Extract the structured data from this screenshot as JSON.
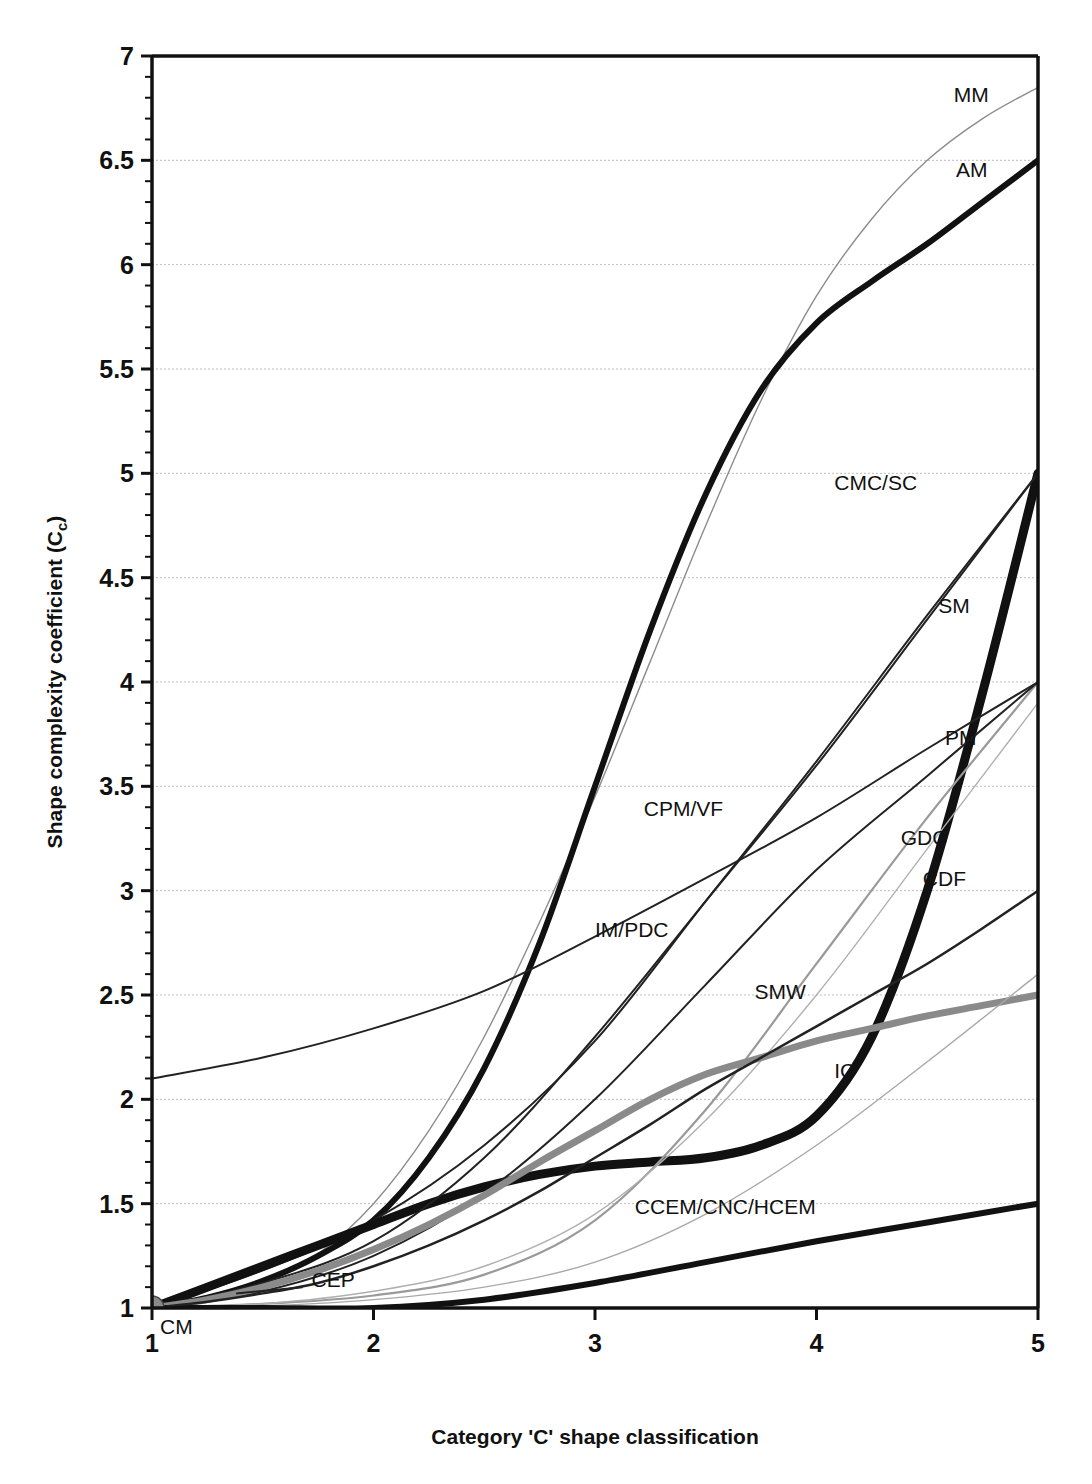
{
  "chart_data": {
    "type": "line",
    "title": "",
    "xlabel": "Category 'C' shape classification",
    "ylabel": "Shape complexity coefficient (C",
    "ylabel_sub": "c",
    "ylabel_tail": ")",
    "xlim": [
      1,
      5
    ],
    "ylim": [
      1,
      7
    ],
    "grid": true,
    "legend_position": "inline-right-labels",
    "x_ticks": [
      "1",
      "2",
      "3",
      "4",
      "5"
    ],
    "x_tick_values": [
      1,
      2,
      3,
      4,
      5
    ],
    "y_ticks": [
      "1",
      "1.5",
      "2",
      "2.5",
      "3",
      "3.5",
      "4",
      "4.5",
      "5",
      "5.5",
      "6",
      "6.5",
      "7"
    ],
    "y_tick_values": [
      1,
      1.5,
      2,
      2.5,
      3,
      3.5,
      4,
      4.5,
      5,
      5.5,
      6,
      6.5,
      7
    ],
    "y_minor_step": 0.1,
    "origin_marker": {
      "label": "CM",
      "x": 1,
      "y": 1,
      "color": "#8a8a8a"
    },
    "series": [
      {
        "name": "MM",
        "style": "thin",
        "color": "#8c8c8c",
        "width": 1.4,
        "label_x": 4.62,
        "label_y": 6.78,
        "points": [
          [
            1,
            1.0
          ],
          [
            1.25,
            1.04
          ],
          [
            1.5,
            1.12
          ],
          [
            1.75,
            1.26
          ],
          [
            2,
            1.5
          ],
          [
            2.25,
            1.85
          ],
          [
            2.5,
            2.3
          ],
          [
            2.75,
            2.85
          ],
          [
            3,
            3.45
          ],
          [
            3.25,
            4.1
          ],
          [
            3.5,
            4.75
          ],
          [
            3.75,
            5.35
          ],
          [
            4,
            5.85
          ],
          [
            4.25,
            6.22
          ],
          [
            4.5,
            6.5
          ],
          [
            4.75,
            6.7
          ],
          [
            5,
            6.85
          ]
        ]
      },
      {
        "name": "AM",
        "style": "thick",
        "color": "#111111",
        "width": 6,
        "label_x": 4.63,
        "label_y": 6.42,
        "points": [
          [
            1,
            1.0
          ],
          [
            1.25,
            1.05
          ],
          [
            1.5,
            1.13
          ],
          [
            1.75,
            1.25
          ],
          [
            2,
            1.42
          ],
          [
            2.25,
            1.72
          ],
          [
            2.5,
            2.15
          ],
          [
            2.75,
            2.75
          ],
          [
            3,
            3.5
          ],
          [
            3.25,
            4.25
          ],
          [
            3.5,
            4.9
          ],
          [
            3.75,
            5.4
          ],
          [
            4,
            5.72
          ],
          [
            4.25,
            5.92
          ],
          [
            4.5,
            6.1
          ],
          [
            4.75,
            6.3
          ],
          [
            5,
            6.5
          ]
        ]
      },
      {
        "name": "CMC/SC",
        "style": "thin",
        "color": "#222222",
        "width": 2,
        "label_x": 4.08,
        "label_y": 4.92,
        "points": [
          [
            1,
            1.0
          ],
          [
            1.5,
            1.18
          ],
          [
            2,
            1.42
          ],
          [
            2.5,
            1.78
          ],
          [
            3,
            2.28
          ],
          [
            3.5,
            2.95
          ],
          [
            4,
            3.62
          ],
          [
            4.5,
            4.32
          ],
          [
            5,
            5.0
          ]
        ]
      },
      {
        "name": "SM",
        "style": "very-thick",
        "color": "#111111",
        "width": 9,
        "label_x": 4.55,
        "label_y": 4.33,
        "points": [
          [
            1,
            1.0
          ],
          [
            1.25,
            1.1
          ],
          [
            1.5,
            1.2
          ],
          [
            1.75,
            1.3
          ],
          [
            2,
            1.4
          ],
          [
            2.25,
            1.5
          ],
          [
            2.5,
            1.58
          ],
          [
            2.75,
            1.64
          ],
          [
            3,
            1.68
          ],
          [
            3.25,
            1.7
          ],
          [
            3.5,
            1.72
          ],
          [
            3.75,
            1.78
          ],
          [
            4,
            1.92
          ],
          [
            4.25,
            2.3
          ],
          [
            4.5,
            3.0
          ],
          [
            4.75,
            3.95
          ],
          [
            5,
            5.0
          ]
        ]
      },
      {
        "name": "PM",
        "style": "thin",
        "color": "#222222",
        "width": 2,
        "label_x": 4.58,
        "label_y": 3.7,
        "points": [
          [
            1,
            2.1
          ],
          [
            1.5,
            2.2
          ],
          [
            2,
            2.34
          ],
          [
            2.5,
            2.52
          ],
          [
            3,
            2.78
          ],
          [
            3.5,
            3.06
          ],
          [
            4,
            3.35
          ],
          [
            4.5,
            3.68
          ],
          [
            5,
            4.0
          ]
        ]
      },
      {
        "name": "CPM/VF",
        "style": "thin",
        "color": "#222222",
        "width": 2,
        "label_x": 3.22,
        "label_y": 3.36,
        "points": [
          [
            1,
            1.0
          ],
          [
            1.5,
            1.12
          ],
          [
            2,
            1.32
          ],
          [
            2.5,
            1.72
          ],
          [
            3,
            2.3
          ],
          [
            3.5,
            2.95
          ],
          [
            4,
            3.6
          ],
          [
            4.5,
            4.3
          ],
          [
            5,
            5.0
          ]
        ]
      },
      {
        "name": "GDC",
        "style": "thin-gray",
        "color": "#9a9a9a",
        "width": 2.2,
        "label_x": 4.38,
        "label_y": 3.22,
        "points": [
          [
            1,
            1.0
          ],
          [
            1.5,
            1.02
          ],
          [
            2,
            1.06
          ],
          [
            2.5,
            1.16
          ],
          [
            3,
            1.42
          ],
          [
            3.5,
            1.95
          ],
          [
            4,
            2.65
          ],
          [
            4.5,
            3.35
          ],
          [
            5,
            4.0
          ]
        ]
      },
      {
        "name": "CDF",
        "style": "thin-light",
        "color": "#b0b0b0",
        "width": 1.4,
        "label_x": 4.48,
        "label_y": 3.02,
        "points": [
          [
            1,
            1.0
          ],
          [
            1.5,
            1.02
          ],
          [
            2,
            1.08
          ],
          [
            2.5,
            1.2
          ],
          [
            3,
            1.45
          ],
          [
            3.5,
            1.9
          ],
          [
            4,
            2.5
          ],
          [
            4.5,
            3.2
          ],
          [
            5,
            3.9
          ]
        ]
      },
      {
        "name": "IM/PDC",
        "style": "thin",
        "color": "#222222",
        "width": 2,
        "label_x": 3.0,
        "label_y": 2.78,
        "points": [
          [
            1,
            1.0
          ],
          [
            1.5,
            1.08
          ],
          [
            2,
            1.25
          ],
          [
            2.5,
            1.55
          ],
          [
            3,
            2.0
          ],
          [
            3.5,
            2.55
          ],
          [
            4,
            3.1
          ],
          [
            4.5,
            3.55
          ],
          [
            5,
            4.0
          ]
        ]
      },
      {
        "name": "SMW",
        "style": "thick-gray",
        "color": "#8a8a8a",
        "width": 7,
        "label_x": 3.72,
        "label_y": 2.48,
        "points": [
          [
            1,
            1.0
          ],
          [
            1.25,
            1.04
          ],
          [
            1.5,
            1.1
          ],
          [
            1.75,
            1.18
          ],
          [
            2,
            1.28
          ],
          [
            2.25,
            1.4
          ],
          [
            2.5,
            1.54
          ],
          [
            2.75,
            1.7
          ],
          [
            3,
            1.85
          ],
          [
            3.25,
            2.0
          ],
          [
            3.5,
            2.12
          ],
          [
            3.75,
            2.2
          ],
          [
            4,
            2.28
          ],
          [
            4.25,
            2.34
          ],
          [
            4.5,
            2.4
          ],
          [
            4.75,
            2.45
          ],
          [
            5,
            2.5
          ]
        ]
      },
      {
        "name": "IC",
        "style": "thin-light",
        "color": "#a8a8a8",
        "width": 1.4,
        "label_x": 4.08,
        "label_y": 2.1,
        "points": [
          [
            1,
            1.0
          ],
          [
            1.5,
            1.01
          ],
          [
            2,
            1.04
          ],
          [
            2.5,
            1.1
          ],
          [
            3,
            1.22
          ],
          [
            3.5,
            1.45
          ],
          [
            4,
            1.78
          ],
          [
            4.5,
            2.18
          ],
          [
            5,
            2.6
          ]
        ]
      },
      {
        "name": "CCEM/CNC/HCEM",
        "style": "thick",
        "color": "#111111",
        "width": 6,
        "label_x": 3.18,
        "label_y": 1.45,
        "points": [
          [
            1,
            1.0
          ],
          [
            1.5,
            1.0
          ],
          [
            2,
            1.0
          ],
          [
            2.5,
            1.04
          ],
          [
            3,
            1.12
          ],
          [
            3.5,
            1.22
          ],
          [
            4,
            1.32
          ],
          [
            4.5,
            1.41
          ],
          [
            5,
            1.5
          ]
        ]
      },
      {
        "name": "CEP",
        "style": "thin",
        "color": "#222222",
        "width": 2.5,
        "label_x": 1.72,
        "label_y": 1.1,
        "leader": [
          [
            1.38,
            1.07
          ],
          [
            1.68,
            1.1
          ]
        ],
        "points": [
          [
            1,
            1.0
          ],
          [
            1.25,
            1.03
          ],
          [
            1.5,
            1.07
          ],
          [
            1.75,
            1.12
          ],
          [
            2,
            1.2
          ],
          [
            2.25,
            1.3
          ],
          [
            2.5,
            1.42
          ],
          [
            2.75,
            1.56
          ],
          [
            3,
            1.72
          ],
          [
            3.25,
            1.88
          ],
          [
            3.5,
            2.05
          ],
          [
            3.75,
            2.2
          ],
          [
            4,
            2.35
          ],
          [
            4.25,
            2.5
          ],
          [
            4.5,
            2.65
          ],
          [
            4.75,
            2.82
          ],
          [
            5,
            3.0
          ]
        ]
      }
    ]
  }
}
